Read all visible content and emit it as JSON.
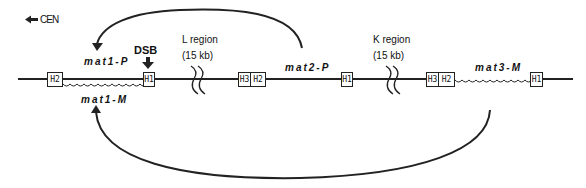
{
  "diagram": {
    "centromere": {
      "label": "CEN",
      "arrow": "left-arrow"
    },
    "loci": {
      "mat1": {
        "upper_label": "mat1-P",
        "lower_label": "mat1-M",
        "boxes": [
          "H2",
          "H1"
        ]
      },
      "mat2": {
        "label": "mat2-P",
        "boxes": [
          "H3",
          "H2",
          "H1"
        ]
      },
      "mat3": {
        "label": "mat3-M",
        "boxes": [
          "H3",
          "H2",
          "H1"
        ]
      }
    },
    "dsb": {
      "label": "DSB"
    },
    "regions": [
      {
        "name": "L region",
        "size": "(15 kb)"
      },
      {
        "name": "K region",
        "size": "(15 kb)"
      }
    ],
    "arrows": [
      {
        "from": "mat2-P",
        "to": "mat1-P",
        "side": "top"
      },
      {
        "from": "mat3-M",
        "to": "mat1-M",
        "side": "bottom"
      }
    ]
  }
}
